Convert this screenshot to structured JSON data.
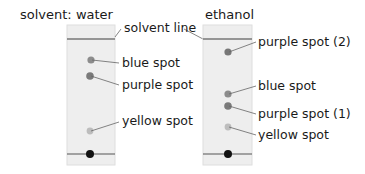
{
  "diagram": {
    "type": "paper chromatography comparison",
    "strips": [
      {
        "title": "solvent: water",
        "labels": {
          "solvent_line": "solvent line",
          "spot_1": "blue spot",
          "spot_2": "purple spot",
          "spot_3": "yellow spot"
        }
      },
      {
        "title": "ethanol",
        "labels": {
          "spot_1": "purple spot (2)",
          "spot_2": "blue spot",
          "spot_3": "purple spot (1)",
          "spot_4": "yellow spot"
        }
      }
    ],
    "colors": {
      "paper": "#eeeeee",
      "paper_border": "#dcdcdc",
      "line": "#777777",
      "spot_dark": "#7a7a7a",
      "spot_blue": "#8a8a8a",
      "spot_yellow": "#b8b8b8",
      "origin_dot": "#111111",
      "leader": "#666666"
    }
  }
}
